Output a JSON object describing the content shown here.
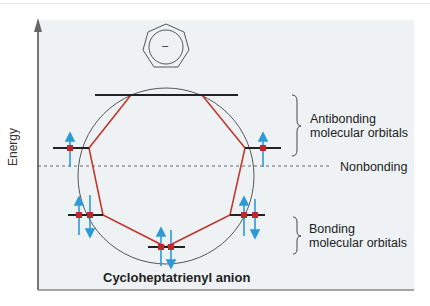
{
  "diagram": {
    "title": "Cycloheptatrienyl anion",
    "axis_label": "Energy",
    "molecule_charge": "–",
    "labels": {
      "antibonding_line1": "Antibonding",
      "antibonding_line2": "molecular orbitals",
      "nonbonding": "Nonbonding",
      "bonding_line1": "Bonding",
      "bonding_line2": "molecular orbitals"
    },
    "colors": {
      "panel_bg": "#eef2f5",
      "heptagon": "#c0392b",
      "electron_dot": "#c0262d",
      "arrow": "#2d9ad6",
      "level_line": "#222222",
      "circle": "#555555"
    },
    "orbital_levels": [
      {
        "name": "antibonding-top",
        "electrons": 0
      },
      {
        "name": "antibonding-left",
        "electrons": 1
      },
      {
        "name": "antibonding-right",
        "electrons": 1
      },
      {
        "name": "bonding-left",
        "electrons": 2
      },
      {
        "name": "bonding-right",
        "electrons": 2
      },
      {
        "name": "bonding-lowest",
        "electrons": 2
      }
    ]
  }
}
